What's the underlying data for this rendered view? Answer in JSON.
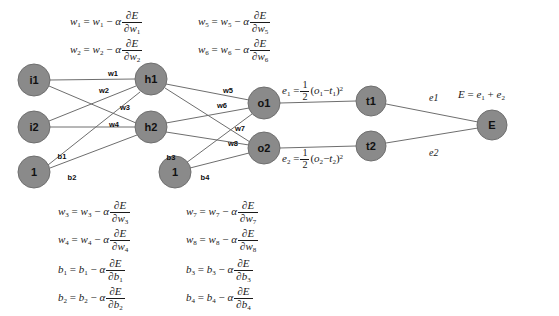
{
  "diagram": {
    "node_fill": "#8a8a8a",
    "node_stroke": "#6f6f6f",
    "edge_color": "#6e6e6e",
    "background": "#ffffff"
  },
  "nodes": {
    "input": [
      {
        "id": "i1",
        "label": "i1",
        "cx": 34,
        "cy": 80,
        "r": 16
      },
      {
        "id": "i2",
        "label": "i2",
        "cx": 34,
        "cy": 127,
        "r": 16
      },
      {
        "id": "bias1",
        "label": "1",
        "cx": 34,
        "cy": 172,
        "r": 16
      }
    ],
    "hidden": [
      {
        "id": "h1",
        "label": "h1",
        "cx": 151,
        "cy": 79,
        "r": 16
      },
      {
        "id": "h2",
        "label": "h2",
        "cx": 151,
        "cy": 127,
        "r": 16
      },
      {
        "id": "bias2",
        "label": "1",
        "cx": 175,
        "cy": 172,
        "r": 16
      }
    ],
    "output": [
      {
        "id": "o1",
        "label": "o1",
        "cx": 264,
        "cy": 103,
        "r": 16
      },
      {
        "id": "o2",
        "label": "o2",
        "cx": 264,
        "cy": 148,
        "r": 16
      }
    ],
    "target": [
      {
        "id": "t1",
        "label": "t1",
        "cx": 371,
        "cy": 101,
        "r": 15
      },
      {
        "id": "t2",
        "label": "t2",
        "cx": 371,
        "cy": 146,
        "r": 15
      }
    ],
    "total": [
      {
        "id": "E",
        "label": "E",
        "cx": 492,
        "cy": 125,
        "r": 15
      }
    ]
  },
  "edge_labels": {
    "w1": {
      "text": "w1",
      "x": 113,
      "y": 73
    },
    "w2": {
      "text": "w2",
      "x": 104,
      "y": 90
    },
    "w3": {
      "text": "w3",
      "x": 125,
      "y": 107
    },
    "w4": {
      "text": "w4",
      "x": 114,
      "y": 124
    },
    "w5": {
      "text": "w5",
      "x": 228,
      "y": 90
    },
    "w6": {
      "text": "w6",
      "x": 222,
      "y": 105
    },
    "w7": {
      "text": "w7",
      "x": 240,
      "y": 128
    },
    "w8": {
      "text": "w8",
      "x": 233,
      "y": 143
    },
    "b1": {
      "text": "b1",
      "x": 62,
      "y": 156
    },
    "b2": {
      "text": "b2",
      "x": 72,
      "y": 177
    },
    "b3": {
      "text": "b3",
      "x": 171,
      "y": 157
    },
    "b4": {
      "text": "b4",
      "x": 205,
      "y": 177
    },
    "e1": {
      "text": "e1",
      "x": 434,
      "y": 101
    },
    "e2": {
      "text": "e2",
      "x": 434,
      "y": 155
    }
  },
  "equations": {
    "top_left": [
      {
        "lhs": "w",
        "lhs_sub": "1",
        "rhs_var": "w",
        "rhs_sub": "1",
        "denom_var": "w",
        "denom_sub": "1"
      },
      {
        "lhs": "w",
        "lhs_sub": "2",
        "rhs_var": "w",
        "rhs_sub": "2",
        "denom_var": "w",
        "denom_sub": "2"
      }
    ],
    "top_right": [
      {
        "lhs": "w",
        "lhs_sub": "5",
        "rhs_var": "w",
        "rhs_sub": "5",
        "denom_var": "w",
        "denom_sub": "5"
      },
      {
        "lhs": "w",
        "lhs_sub": "6",
        "rhs_var": "w",
        "rhs_sub": "6",
        "denom_var": "w",
        "denom_sub": "6"
      }
    ],
    "bottom_left": [
      {
        "lhs": "w",
        "lhs_sub": "3",
        "rhs_var": "w",
        "rhs_sub": "3",
        "denom_var": "w",
        "denom_sub": "3"
      },
      {
        "lhs": "w",
        "lhs_sub": "4",
        "rhs_var": "w",
        "rhs_sub": "4",
        "denom_var": "w",
        "denom_sub": "4"
      },
      {
        "lhs": "b",
        "lhs_sub": "1",
        "rhs_var": "b",
        "rhs_sub": "1",
        "denom_var": "b",
        "denom_sub": "1"
      },
      {
        "lhs": "b",
        "lhs_sub": "2",
        "rhs_var": "b",
        "rhs_sub": "2",
        "denom_var": "b",
        "denom_sub": "2"
      }
    ],
    "bottom_right": [
      {
        "lhs": "w",
        "lhs_sub": "7",
        "rhs_var": "w",
        "rhs_sub": "7",
        "denom_var": "w",
        "denom_sub": "7"
      },
      {
        "lhs": "w",
        "lhs_sub": "8",
        "rhs_var": "w",
        "rhs_sub": "8",
        "denom_var": "w",
        "denom_sub": "8"
      },
      {
        "lhs": "b",
        "lhs_sub": "3",
        "rhs_var": "b",
        "rhs_sub": "3",
        "denom_var": "b",
        "denom_sub": "3"
      },
      {
        "lhs": "b",
        "lhs_sub": "4",
        "rhs_var": "b",
        "rhs_sub": "4",
        "denom_var": "b",
        "denom_sub": "4"
      }
    ],
    "symbols": {
      "equals": "=",
      "minus": "−",
      "alpha": "α",
      "partial": "∂",
      "E": "E",
      "plus": "+"
    },
    "error_e1": {
      "lhs": "e",
      "lhs_sub": "1",
      "half_num": "1",
      "half_den": "2",
      "out_var": "o",
      "out_sub": "1",
      "target_var": "t",
      "target_sub": "1",
      "power": "2"
    },
    "error_e2": {
      "lhs": "e",
      "lhs_sub": "2",
      "half_num": "1",
      "half_den": "2",
      "out_var": "o",
      "out_sub": "2",
      "target_var": "t",
      "target_sub": "2",
      "power": "2"
    },
    "total_error": {
      "lhs": "E",
      "term1": "e",
      "term1_sub": "1",
      "term2": "e",
      "term2_sub": "2"
    }
  },
  "layout": {
    "eq_top_left_x": 70,
    "eq_top_left_y": 8,
    "eq_top_right_x": 198,
    "eq_top_right_y": 8,
    "eq_bottom_left_x": 58,
    "eq_bottom_left_y": 198,
    "eq_bottom_right_x": 186,
    "eq_bottom_right_y": 198,
    "err1_x": 282,
    "err1_y": 80,
    "err2_x": 282,
    "err2_y": 148,
    "total_x": 458,
    "total_y": 88
  }
}
